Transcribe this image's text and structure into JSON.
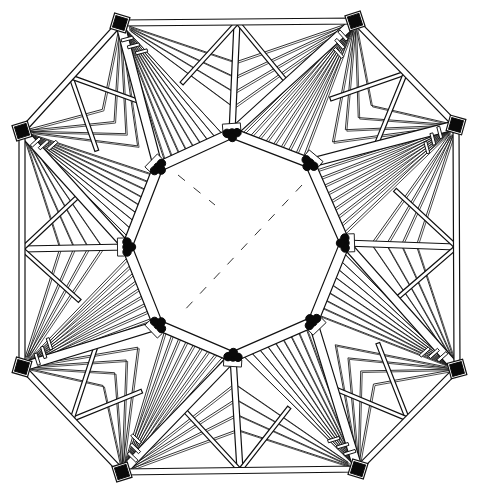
{
  "drawing": {
    "title": "Octagonal roof framing plan",
    "description": "Line drawing of an octagonal timber roof structure seen from above, with an open octagonal lantern/oculus at the center, radiating rafters fanning from outer corner posts to inner ring nodes, and dashed hidden lines across the central opening.",
    "colors": {
      "ink": "#111111",
      "paper": "#ffffff"
    },
    "canvas": {
      "width": 484,
      "height": 497
    },
    "outer_ring": {
      "label": "outer wall plate",
      "corners": [
        [
          120,
          23
        ],
        [
          355,
          21
        ],
        [
          456,
          125
        ],
        [
          457,
          369
        ],
        [
          358,
          469
        ],
        [
          122,
          472
        ],
        [
          22,
          367
        ],
        [
          22,
          131
        ]
      ],
      "beam_width": 6
    },
    "inner_ring": {
      "label": "inner compression ring",
      "nodes": [
        [
          232,
          133
        ],
        [
          310,
          163
        ],
        [
          345,
          243
        ],
        [
          313,
          322
        ],
        [
          233,
          357
        ],
        [
          158,
          325
        ],
        [
          127,
          247
        ],
        [
          158,
          167
        ]
      ],
      "beam_width": 10
    },
    "hips": {
      "label": "hip beams",
      "pairs": [
        [
          0,
          7
        ],
        [
          1,
          0
        ],
        [
          2,
          1
        ],
        [
          3,
          2
        ],
        [
          4,
          3
        ],
        [
          5,
          4
        ],
        [
          6,
          5
        ],
        [
          7,
          6
        ]
      ]
    },
    "edge_midpoint_struts": {
      "label": "king posts at outer edge midpoints",
      "points": [
        [
          237,
          22
        ],
        [
          456,
          247
        ],
        [
          240,
          470
        ],
        [
          22,
          249
        ]
      ]
    },
    "fan_rafters_per_corner": 9,
    "dashed_lines": [
      [
        [
          178,
          175
        ],
        [
          215,
          205
        ]
      ],
      [
        [
          302,
          185
        ],
        [
          180,
          315
        ]
      ]
    ]
  }
}
